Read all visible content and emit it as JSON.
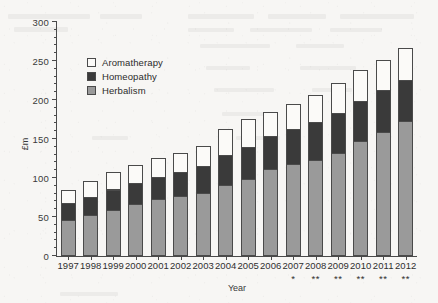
{
  "chart_data": {
    "type": "bar",
    "stacked": true,
    "title": "",
    "xlabel": "Year",
    "ylabel": "£m",
    "ylim": [
      0,
      300
    ],
    "yticks": [
      0,
      50,
      100,
      150,
      200,
      250,
      300
    ],
    "ytick_labels": [
      "0",
      "50",
      "100",
      "150",
      "200",
      "250",
      "300"
    ],
    "grid": false,
    "legend_position": "upper-left-inside",
    "categories": [
      "1997",
      "1998",
      "1999",
      "2000",
      "2001",
      "2002",
      "2003",
      "2004",
      "2005",
      "2006",
      "2007",
      "2008",
      "2009",
      "2010",
      "2011",
      "2012"
    ],
    "category_notes": [
      "",
      "",
      "",
      "",
      "",
      "",
      "",
      "",
      "",
      "",
      "*",
      "**",
      "**",
      "**",
      "**",
      "**"
    ],
    "series": [
      {
        "name": "Herbalism",
        "color": "#9a9a9a",
        "values": [
          45,
          51,
          58,
          66,
          72,
          76,
          80,
          90,
          97,
          110,
          117,
          122,
          131,
          146,
          158,
          172
        ]
      },
      {
        "name": "Homeopathy",
        "color": "#3a3a3a",
        "values": [
          22,
          23,
          26,
          26,
          28,
          30,
          34,
          38,
          41,
          43,
          45,
          48,
          51,
          52,
          54,
          52
        ]
      },
      {
        "name": "Aromatherapy",
        "color": "#fbfaf8",
        "values": [
          17,
          21,
          23,
          24,
          24,
          25,
          26,
          34,
          37,
          31,
          31,
          35,
          39,
          39,
          38,
          41
        ]
      }
    ],
    "totals": [
      84,
      95,
      107,
      116,
      124,
      131,
      140,
      162,
      175,
      184,
      193,
      205,
      221,
      237,
      250,
      265
    ]
  },
  "legend": {
    "items": [
      {
        "label": "Aromatherapy",
        "swatch": "#fbfaf8"
      },
      {
        "label": "Homeopathy",
        "swatch": "#3a3a3a"
      },
      {
        "label": "Herbalism",
        "swatch": "#9a9a9a"
      }
    ]
  },
  "axes": {
    "y_title": "£m",
    "x_title": "Year"
  }
}
